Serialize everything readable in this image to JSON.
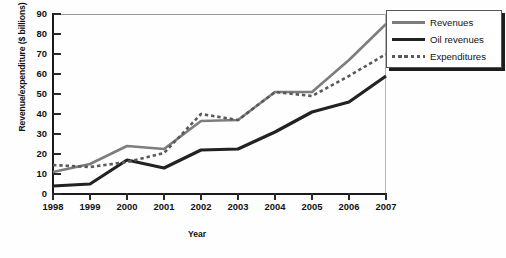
{
  "chart_data": {
    "type": "line",
    "title": "",
    "xlabel": "Year",
    "ylabel": "Revenue/expenditure ($ billions)",
    "categories": [
      "1998",
      "1999",
      "2000",
      "2001",
      "2002",
      "2003",
      "2004",
      "2005",
      "2006",
      "2007"
    ],
    "x": [
      1998,
      1999,
      2000,
      2001,
      2002,
      2003,
      2004,
      2005,
      2006,
      2007
    ],
    "xlim": [
      1998,
      2007
    ],
    "ylim": [
      0,
      90
    ],
    "yticks": [
      0,
      10,
      20,
      30,
      40,
      50,
      60,
      70,
      80,
      90
    ],
    "grid": false,
    "legend_position": "top-right",
    "series": [
      {
        "name": "Revenues",
        "style": "solid",
        "color": "#7d7d7d",
        "values": [
          11,
          15,
          24,
          22.5,
          36.5,
          37,
          51,
          51,
          67,
          85
        ]
      },
      {
        "name": "Oil revenues",
        "style": "solid",
        "color": "#222222",
        "values": [
          4,
          5,
          17,
          13,
          22,
          22.5,
          31,
          41,
          46,
          59
        ]
      },
      {
        "name": "Expenditures",
        "style": "dotted",
        "color": "#5a5a5a",
        "values": [
          14.5,
          13.5,
          16,
          20.5,
          40,
          37,
          51,
          49,
          59,
          70
        ]
      }
    ]
  },
  "axes": {
    "y_title": "Revenue/expenditure ($ billions)",
    "x_title": "Year",
    "y_tick_labels": [
      "0",
      "10",
      "20",
      "30",
      "40",
      "50",
      "60",
      "70",
      "80",
      "90"
    ],
    "x_tick_labels": [
      "1998",
      "1999",
      "2000",
      "2001",
      "2002",
      "2003",
      "2004",
      "2005",
      "2006",
      "2007"
    ]
  },
  "legend": {
    "items": [
      {
        "label": "Revenues",
        "swatch": "solid-gray-line"
      },
      {
        "label": "Oil revenues",
        "swatch": "solid-black-line"
      },
      {
        "label": "Expenditures",
        "swatch": "dotted-gray-line"
      }
    ]
  }
}
